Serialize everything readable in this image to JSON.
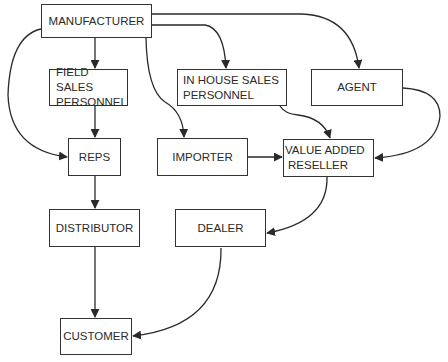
{
  "diagram": {
    "title": "",
    "colors": {
      "line": "#2a2a2a",
      "box_border": "#333333",
      "background": "#ffffff",
      "text": "#2a2a2a"
    },
    "nodes": {
      "manufacturer": {
        "label": "MANUFACTURER"
      },
      "field_sales": {
        "line1": "FIELD SALES",
        "line2": "PERSONNEL"
      },
      "in_house_sales": {
        "line1": "IN HOUSE SALES",
        "line2": "PERSONNEL"
      },
      "agent": {
        "label": "AGENT"
      },
      "reps": {
        "label": "REPS"
      },
      "importer": {
        "label": "IMPORTER"
      },
      "var": {
        "line1": "VALUE ADDED",
        "line2": "RESELLER"
      },
      "distributor": {
        "label": "DISTRIBUTOR"
      },
      "dealer": {
        "label": "DEALER"
      },
      "customer": {
        "label": "CUSTOMER"
      }
    },
    "edges": [
      {
        "from": "MANUFACTURER",
        "to": "FIELD SALES PERSONNEL"
      },
      {
        "from": "MANUFACTURER",
        "to": "IN HOUSE SALES PERSONNEL"
      },
      {
        "from": "MANUFACTURER",
        "to": "AGENT"
      },
      {
        "from": "MANUFACTURER",
        "to": "REPS"
      },
      {
        "from": "MANUFACTURER",
        "to": "IMPORTER"
      },
      {
        "from": "FIELD SALES PERSONNEL",
        "to": "REPS"
      },
      {
        "from": "IN HOUSE SALES PERSONNEL",
        "to": "VALUE ADDED RESELLER"
      },
      {
        "from": "AGENT",
        "to": "VALUE ADDED RESELLER"
      },
      {
        "from": "IMPORTER",
        "to": "VALUE ADDED RESELLER"
      },
      {
        "from": "REPS",
        "to": "DISTRIBUTOR"
      },
      {
        "from": "VALUE ADDED RESELLER",
        "to": "DEALER"
      },
      {
        "from": "DISTRIBUTOR",
        "to": "CUSTOMER"
      },
      {
        "from": "DEALER",
        "to": "CUSTOMER"
      }
    ]
  }
}
